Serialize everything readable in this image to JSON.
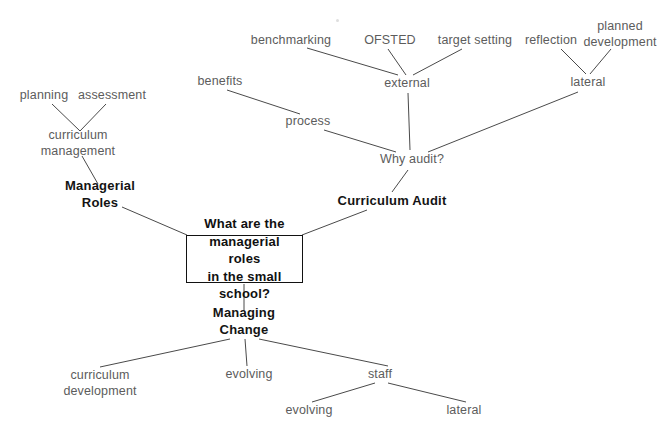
{
  "diagram": {
    "canvas": {
      "width": 663,
      "height": 439
    },
    "colors": {
      "background": "#ffffff",
      "text": "#5c5c5c",
      "emphasis_text": "#141414",
      "line": "#4a4a4a",
      "box_border": "#121212"
    },
    "central_node": {
      "label": "What are the managerial roles in the small school?",
      "line1": "What are the",
      "line2": "managerial roles",
      "line3": "in the small school?",
      "x": 244,
      "y": 259,
      "width": 117,
      "height": 48
    },
    "nodes": [
      {
        "id": "planning",
        "label": "planning",
        "x": 44,
        "y": 96,
        "bold": false
      },
      {
        "id": "assessment",
        "label": "assessment",
        "x": 112,
        "y": 96,
        "bold": false
      },
      {
        "id": "curriculum-management",
        "label": "curriculum management",
        "line1": "curriculum",
        "line2": "management",
        "x": 78,
        "y": 143,
        "bold": false,
        "multiline": true
      },
      {
        "id": "managerial-roles",
        "label": "Managerial Roles",
        "line1": "Managerial",
        "line2": "Roles",
        "x": 100,
        "y": 195,
        "bold": true,
        "multiline": true
      },
      {
        "id": "benchmarking",
        "label": "benchmarking",
        "x": 291,
        "y": 41,
        "bold": false
      },
      {
        "id": "ofsted",
        "label": "OFSTED",
        "x": 390,
        "y": 41,
        "bold": false
      },
      {
        "id": "target-setting",
        "label": "target setting",
        "x": 475,
        "y": 41,
        "bold": false
      },
      {
        "id": "reflection",
        "label": "reflection",
        "x": 551,
        "y": 41,
        "bold": false
      },
      {
        "id": "planned-development",
        "label": "planned development",
        "line1": "planned",
        "line2": "development",
        "x": 620,
        "y": 34,
        "bold": false,
        "multiline": true
      },
      {
        "id": "external",
        "label": "external",
        "x": 407,
        "y": 84,
        "bold": false
      },
      {
        "id": "lateral-top",
        "label": "lateral",
        "x": 588,
        "y": 83,
        "bold": false
      },
      {
        "id": "benefits",
        "label": "benefits",
        "x": 220,
        "y": 82,
        "bold": false
      },
      {
        "id": "process",
        "label": "process",
        "x": 308,
        "y": 122,
        "bold": false
      },
      {
        "id": "why-audit",
        "label": "Why audit?",
        "x": 412,
        "y": 160,
        "bold": false
      },
      {
        "id": "curriculum-audit",
        "label": "Curriculum Audit",
        "x": 392,
        "y": 201,
        "bold": true
      },
      {
        "id": "managing-change",
        "label": "Managing Change",
        "line1": "Managing",
        "line2": "Change",
        "x": 244,
        "y": 322,
        "bold": true,
        "multiline": true
      },
      {
        "id": "curriculum-development",
        "label": "curriculum development",
        "line1": "curriculum",
        "line2": "development",
        "x": 100,
        "y": 383,
        "bold": false,
        "multiline": true
      },
      {
        "id": "evolving-mid",
        "label": "evolving",
        "x": 249,
        "y": 375,
        "bold": false
      },
      {
        "id": "staff",
        "label": "staff",
        "x": 380,
        "y": 375,
        "bold": false
      },
      {
        "id": "evolving-low",
        "label": "evolving",
        "x": 309,
        "y": 411,
        "bold": false
      },
      {
        "id": "lateral-low",
        "label": "lateral",
        "x": 464,
        "y": 411,
        "bold": false
      }
    ],
    "edges": [
      {
        "from": "planning",
        "to": "curriculum-management",
        "x1": 52,
        "y1": 104,
        "x2": 80,
        "y2": 131
      },
      {
        "from": "assessment",
        "to": "curriculum-management",
        "x1": 106,
        "y1": 104,
        "x2": 80,
        "y2": 131
      },
      {
        "from": "curriculum-management",
        "to": "managerial-roles",
        "x1": 82,
        "y1": 156,
        "x2": 98,
        "y2": 184
      },
      {
        "from": "managerial-roles",
        "to": "central",
        "x1": 122,
        "y1": 207,
        "x2": 187,
        "y2": 235
      },
      {
        "from": "benchmarking",
        "to": "external",
        "x1": 307,
        "y1": 48,
        "x2": 398,
        "y2": 75
      },
      {
        "from": "ofsted",
        "to": "external",
        "x1": 388,
        "y1": 49,
        "x2": 406,
        "y2": 75
      },
      {
        "from": "target-setting",
        "to": "external",
        "x1": 462,
        "y1": 49,
        "x2": 413,
        "y2": 75
      },
      {
        "from": "reflection",
        "to": "lateral-top",
        "x1": 561,
        "y1": 49,
        "x2": 586,
        "y2": 74
      },
      {
        "from": "planned-development",
        "to": "lateral-top",
        "x1": 611,
        "y1": 49,
        "x2": 590,
        "y2": 74
      },
      {
        "from": "external",
        "to": "why-audit",
        "x1": 408,
        "y1": 93,
        "x2": 410,
        "y2": 150
      },
      {
        "from": "benefits",
        "to": "process",
        "x1": 227,
        "y1": 90,
        "x2": 300,
        "y2": 114
      },
      {
        "from": "process",
        "to": "why-audit",
        "x1": 324,
        "y1": 130,
        "x2": 396,
        "y2": 152
      },
      {
        "from": "lateral-top",
        "to": "why-audit",
        "x1": 578,
        "y1": 92,
        "x2": 428,
        "y2": 152
      },
      {
        "from": "why-audit",
        "to": "curriculum-audit",
        "x1": 408,
        "y1": 170,
        "x2": 392,
        "y2": 192
      },
      {
        "from": "curriculum-audit",
        "to": "central",
        "x1": 367,
        "y1": 210,
        "x2": 302,
        "y2": 235
      },
      {
        "from": "central",
        "to": "managing-change",
        "x1": 244,
        "y1": 284,
        "x2": 244,
        "y2": 311
      },
      {
        "from": "managing-change",
        "to": "curriculum-development",
        "x1": 230,
        "y1": 339,
        "x2": 100,
        "y2": 367
      },
      {
        "from": "managing-change",
        "to": "evolving-mid",
        "x1": 245,
        "y1": 339,
        "x2": 247,
        "y2": 366
      },
      {
        "from": "managing-change",
        "to": "staff",
        "x1": 259,
        "y1": 339,
        "x2": 388,
        "y2": 366
      },
      {
        "from": "staff",
        "to": "evolving-low",
        "x1": 375,
        "y1": 383,
        "x2": 312,
        "y2": 402
      },
      {
        "from": "staff",
        "to": "lateral-low",
        "x1": 388,
        "y1": 383,
        "x2": 466,
        "y2": 402
      }
    ]
  }
}
